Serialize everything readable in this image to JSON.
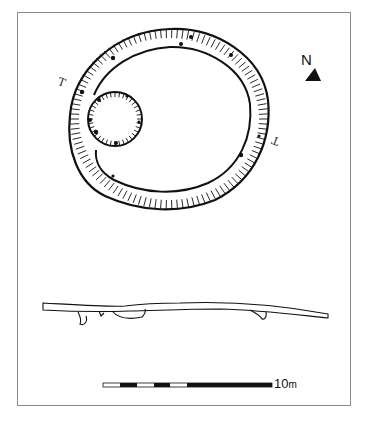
{
  "figure": {
    "type": "archaeological plan and section",
    "north_arrow": {
      "label": "N",
      "icon": "north-arrow-icon"
    },
    "section_markers": [
      "T",
      "T"
    ],
    "scale_bar": {
      "label_value": "10",
      "label_unit": "m",
      "segments": [
        "white",
        "black",
        "white",
        "black",
        "white",
        "black"
      ]
    },
    "colors": {
      "ink": "#111111",
      "frame": "#8a8a8a",
      "paper": "#ffffff"
    }
  }
}
